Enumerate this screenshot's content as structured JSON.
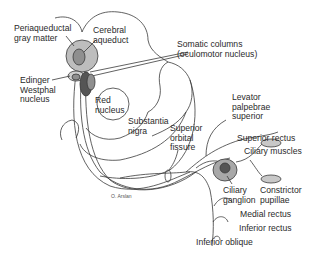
{
  "diagram": {
    "colors": {
      "line": "#3a3a3a",
      "light_gray": "#bdbdbd",
      "mid_gray": "#8f8f8f",
      "dark_gray": "#555555",
      "background": "#ffffff"
    },
    "labels": {
      "periaqueductal": "Periaqueductal\ngray matter",
      "cerebral_aqueduct": "Cerebral\naqueduct",
      "somatic_columns": "Somatic columns\n(oculomotor nucleus)",
      "edinger_westphal": "Edinger\nWestphal\nnucleus",
      "red_nucleus": "Red\nnucleus",
      "substantia_nigra": "Substantia\nnigra",
      "superior_orbital_fissure": "Superior\norbital\nfissure",
      "levator": "Levator\npalpebrae\nsuperior",
      "superior_rectus": "Superior rectus",
      "ciliary_muscles": "Ciliary muscles",
      "ciliary_ganglion": "Ciliary\nganglion",
      "constrictor_pupillae": "Constrictor\npupillae",
      "medial_rectus": "Medial rectus",
      "inferior_rectus": "Inferior rectus",
      "inferior_oblique": "Inferior oblique"
    },
    "credit": "O. Arslan"
  }
}
